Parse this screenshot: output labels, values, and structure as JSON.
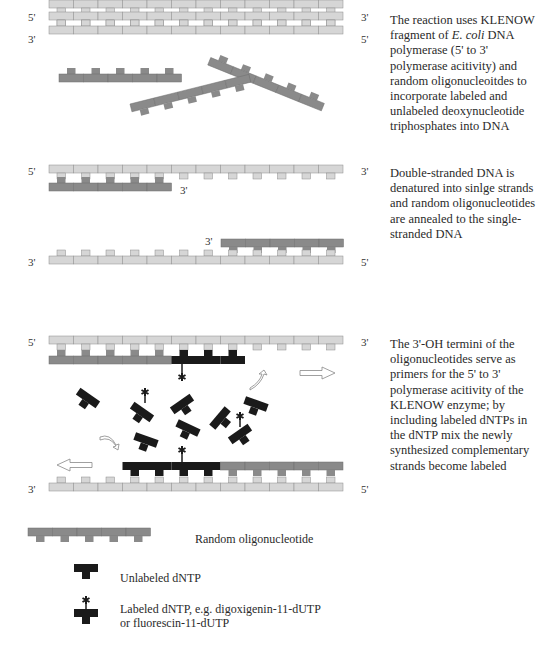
{
  "panel1": {
    "top_strand_left": "5'",
    "top_strand_right": "3'",
    "bottom_strand_left": "3'",
    "bottom_strand_right": "5'",
    "description_lines": [
      "The reaction uses KLENOW",
      "fragment of ",
      "E. coli",
      " DNA",
      "polymerase (5' to 3'",
      "polymerase acitivity) and",
      "random oligonucleoitdes to",
      "incorporate labeled and",
      "unlabeled  deoxynucleotide",
      "triphosphates  into DNA"
    ]
  },
  "panel2": {
    "top_strand_left": "5'",
    "top_strand_right": "3'",
    "primer1_end": "3'",
    "primer2_end": "3'",
    "bottom_strand_left": "3'",
    "bottom_strand_right": "5'",
    "description": "Double-stranded DNA is\ndenatured into sinlge strands\nand random oligonucleotides\nare annealed to the single-\nstranded DNA"
  },
  "panel3": {
    "top_strand_left": "5'",
    "top_strand_right": "3'",
    "bottom_strand_left": "3'",
    "bottom_strand_right": "5'",
    "description": "The 3'-OH termini of the\noligonucleotides serve as\nprimers for the 5' to 3'\npolymerase acitivity of the\nKLENOW enzyme; by\nincluding labeled dNTPs in\nthe dNTP mix the newly\nsynthesized complementary\nstrands become labeled"
  },
  "legend": {
    "oligo": "Random oligonucleotide",
    "unlabeled": "Unlabeled dNTP",
    "labeled": "Labeled dNTP, e.g. digoxigenin-11-dUTP\nor fluorescin-11-dUTP"
  },
  "colors": {
    "template_strand": "#d6d6d6",
    "oligo": "#8a8a8a",
    "dntp": "#1a1a1a",
    "outline": "#777777"
  }
}
